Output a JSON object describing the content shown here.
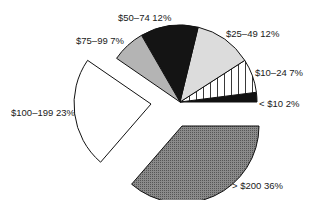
{
  "chart_data": {
    "type": "pie",
    "title": "",
    "categories": [
      "< $10",
      "$10–24",
      "$25–49",
      "$50–74",
      "$75–99",
      "$100–199",
      "> $200"
    ],
    "values": [
      2,
      7,
      12,
      12,
      7,
      23,
      36
    ],
    "unit": "%",
    "exploded": [
      "$100–199",
      "> $200"
    ],
    "fills": [
      "#111111",
      "hatch-vertical",
      "#dcdcdc",
      "#141414",
      "#b4b4b4",
      "#ffffff",
      "#7a7a7a"
    ],
    "labels": [
      "< $10 2%",
      "$10–24 7%",
      "$25–49 12%",
      "$50–74 12%",
      "$75–99 7%",
      "$100–199 23%",
      "> $200 36%"
    ],
    "legend": "none (inline labels)"
  }
}
